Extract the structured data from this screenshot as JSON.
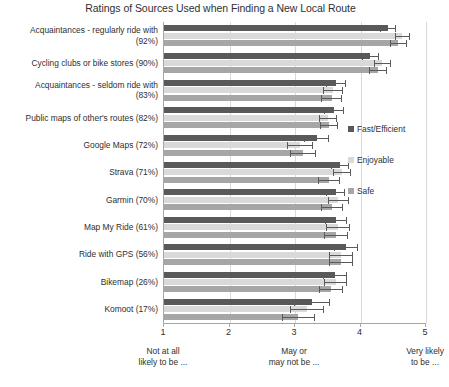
{
  "chart_data": {
    "type": "bar",
    "orientation": "horizontal",
    "title": "Ratings of Sources Used when Finding a New Local Route",
    "xlabel": "",
    "ylabel": "",
    "xlim": [
      1,
      5
    ],
    "xticks": [
      1,
      2,
      3,
      4,
      5
    ],
    "xtick_labels": [
      "1",
      "2",
      "3",
      "4",
      "5"
    ],
    "grid": true,
    "legend_position": "center-right",
    "axis_anchors": [
      {
        "value": 1,
        "line1": "Not at all",
        "line2": "likely to be ..."
      },
      {
        "value": 3,
        "line1": "May or",
        "line2": "may not be ..."
      },
      {
        "value": 5,
        "line1": "Very likely",
        "line2": "to be ..."
      }
    ],
    "categories": [
      "Acquaintances - regularly ride with (92%)",
      "Cycling clubs or bike stores (90%)",
      "Acquaintances - seldom ride with (83%)",
      "Public maps of other's routes (82%)",
      "Google Maps (72%)",
      "Strava (71%)",
      "Garmin (70%)",
      "Map My Ride (61%)",
      "Ride with GPS (56%)",
      "Bikemap (26%)",
      "Komoot (17%)"
    ],
    "category_lines": [
      [
        "Acquaintances - regularly ride with",
        "(92%)"
      ],
      [
        "Cycling clubs or bike stores (90%)"
      ],
      [
        "Acquaintances - seldom ride with",
        "(83%)"
      ],
      [
        "Public maps of other's routes (82%)"
      ],
      [
        "Google Maps (72%)"
      ],
      [
        "Strava (71%)"
      ],
      [
        "Garmin (70%)"
      ],
      [
        "Map My Ride (61%)"
      ],
      [
        "Ride with GPS (56%)"
      ],
      [
        "Bikemap (26%)"
      ],
      [
        "Komoot (17%)"
      ]
    ],
    "series": [
      {
        "name": "Fast/Efficient",
        "color": "#595959",
        "values": [
          4.42,
          4.15,
          3.63,
          3.6,
          3.33,
          3.69,
          3.62,
          3.63,
          3.78,
          3.61,
          3.26
        ],
        "err_low": [
          4.3,
          4.02,
          3.48,
          3.45,
          3.14,
          3.55,
          3.47,
          3.46,
          3.6,
          3.42,
          2.98
        ],
        "err_high": [
          4.54,
          4.28,
          3.78,
          3.75,
          3.52,
          3.83,
          3.77,
          3.8,
          3.96,
          3.8,
          3.54
        ]
      },
      {
        "name": "Enjoyable",
        "color": "#d9d9d9",
        "values": [
          4.64,
          4.33,
          3.58,
          3.5,
          3.08,
          3.72,
          3.66,
          3.66,
          3.7,
          3.62,
          3.18
        ],
        "err_low": [
          4.52,
          4.2,
          3.42,
          3.36,
          2.88,
          3.58,
          3.5,
          3.48,
          3.52,
          3.44,
          2.92
        ],
        "err_high": [
          4.76,
          4.46,
          3.74,
          3.64,
          3.28,
          3.86,
          3.82,
          3.84,
          3.88,
          3.8,
          3.44
        ]
      },
      {
        "name": "Safe",
        "color": "#a6a6a6",
        "values": [
          4.58,
          4.27,
          3.56,
          3.52,
          3.12,
          3.52,
          3.57,
          3.63,
          3.7,
          3.55,
          3.05
        ],
        "err_low": [
          4.45,
          4.13,
          3.4,
          3.38,
          2.92,
          3.35,
          3.4,
          3.45,
          3.52,
          3.36,
          2.8
        ],
        "err_high": [
          4.71,
          4.41,
          3.72,
          3.66,
          3.32,
          3.69,
          3.74,
          3.81,
          3.88,
          3.74,
          3.3
        ]
      }
    ]
  },
  "legend": {
    "items": [
      {
        "label": "Fast/Efficient",
        "color": "#595959"
      },
      {
        "label": "Enjoyable",
        "color": "#d9d9d9"
      },
      {
        "label": "Safe",
        "color": "#a6a6a6"
      }
    ]
  }
}
